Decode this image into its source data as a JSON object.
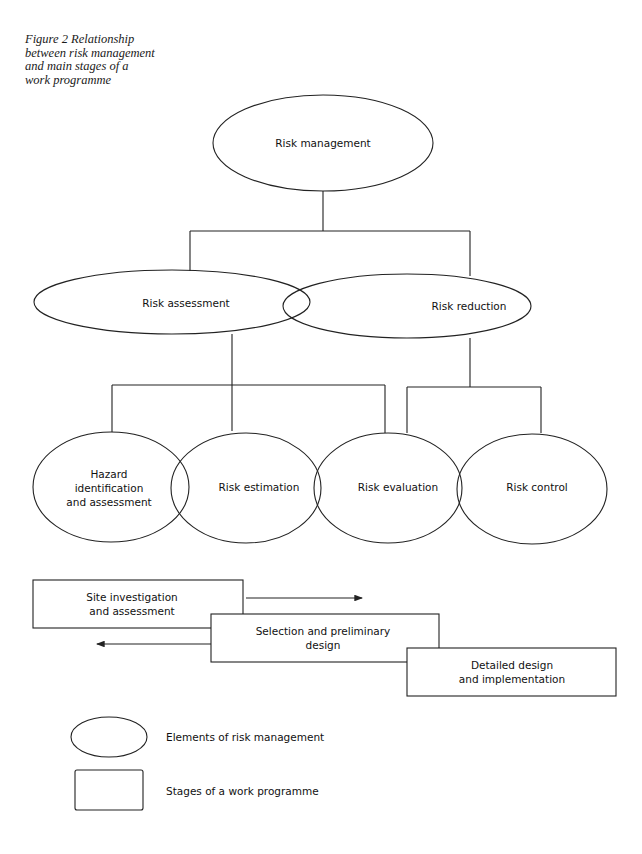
{
  "caption": {
    "lines": [
      "Figure 2  Relationship",
      "between risk management",
      "and main stages of a",
      "work programme"
    ]
  },
  "nodes": {
    "risk_management": "Risk management",
    "risk_assessment": "Risk assessment",
    "risk_reduction": "Risk reduction",
    "hazard": [
      "Hazard",
      "identification",
      "and assessment"
    ],
    "risk_estimation": "Risk estimation",
    "risk_evaluation": "Risk evaluation",
    "risk_control": "Risk control"
  },
  "stages": {
    "site": [
      "Site investigation",
      "and assessment"
    ],
    "selection": [
      "Selection and preliminary",
      "design"
    ],
    "detailed": [
      "Detailed design",
      "and implementation"
    ]
  },
  "legend": {
    "ellipse_label": "Elements of risk management",
    "rect_label": "Stages of a work programme"
  },
  "colors": {
    "stroke": "#222222",
    "background": "#ffffff"
  }
}
